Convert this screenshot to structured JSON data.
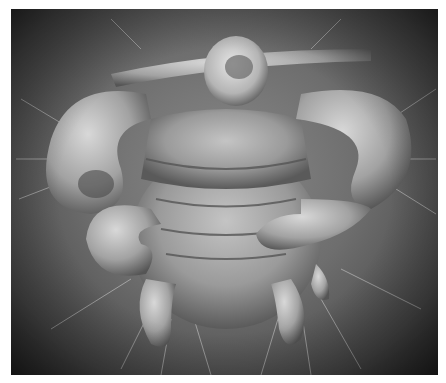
{
  "image": {
    "subject": "scanning electron micrograph of a louse (ventral view)",
    "colors": {
      "background": "#ffffff",
      "photo_mid": "#7a7a7a",
      "photo_dark": "#2a2a2a",
      "specimen_light": "#c8c8c8",
      "specimen_mid": "#9a9a9a",
      "specimen_shadow": "#4e4e4e"
    }
  }
}
